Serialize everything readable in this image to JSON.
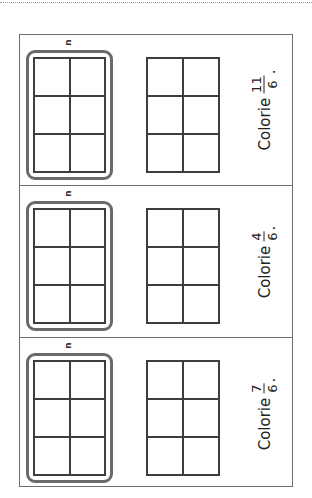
{
  "worksheet": {
    "panels": [
      {
        "id": "panel-1",
        "instruction_word": "Colorie",
        "fraction": {
          "numerator": "11",
          "denominator": "6"
        },
        "punctuation": ".",
        "marker": "n",
        "grids": [
          {
            "role": "whole-unit",
            "highlighted": true,
            "columns": 2,
            "rows": 3,
            "cells_colored": 0
          },
          {
            "role": "extra-unit",
            "highlighted": false,
            "columns": 2,
            "rows": 3,
            "cells_colored": 0
          }
        ]
      },
      {
        "id": "panel-2",
        "instruction_word": "Colorie",
        "fraction": {
          "numerator": "4",
          "denominator": "6"
        },
        "punctuation": ".",
        "marker": "n",
        "grids": [
          {
            "role": "whole-unit",
            "highlighted": true,
            "columns": 2,
            "rows": 3,
            "cells_colored": 0
          },
          {
            "role": "extra-unit",
            "highlighted": false,
            "columns": 2,
            "rows": 3,
            "cells_colored": 0
          }
        ]
      },
      {
        "id": "panel-3",
        "instruction_word": "Colorie",
        "fraction": {
          "numerator": "7",
          "denominator": "6"
        },
        "punctuation": ".",
        "marker": "n",
        "grids": [
          {
            "role": "whole-unit",
            "highlighted": true,
            "columns": 2,
            "rows": 3,
            "cells_colored": 0
          },
          {
            "role": "extra-unit",
            "highlighted": false,
            "columns": 2,
            "rows": 3,
            "cells_colored": 0
          }
        ]
      }
    ],
    "colors": {
      "frame": "#6e6e6e",
      "grid_line": "#3e3e3e",
      "highlight_box": "#6a6a6a",
      "text": "#222222",
      "background": "#ffffff"
    }
  }
}
